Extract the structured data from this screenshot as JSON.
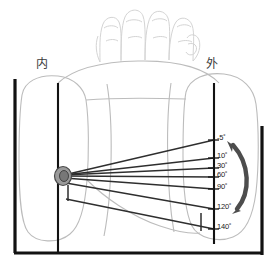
{
  "diagram": {
    "side_labels": [
      {
        "name": "medial",
        "text": "内",
        "x": 36,
        "y": 61
      },
      {
        "name": "lateral",
        "text": "外",
        "x": 206,
        "y": 61
      }
    ],
    "angle_scale": {
      "axis_x": 214,
      "labels": [
        {
          "text": "-5˚",
          "value": -5,
          "y": 135,
          "tick_y": 140
        },
        {
          "text": "10˚",
          "value": 10,
          "y": 153,
          "tick_y": 158
        },
        {
          "text": "30˚",
          "value": 30,
          "y": 163,
          "tick_y": 168
        },
        {
          "text": "60˚",
          "value": 60,
          "y": 172,
          "tick_y": 177
        },
        {
          "text": "90˚",
          "value": 90,
          "y": 184,
          "tick_y": 189
        },
        {
          "text": "120˚",
          "value": 120,
          "y": 204,
          "tick_y": 209
        },
        {
          "text": "140˚",
          "value": 140,
          "y": 224,
          "tick_y": 229
        }
      ]
    },
    "colors": {
      "frame": "#121212",
      "ray": "#303030",
      "scale_axis": "#121212",
      "arc_arrow": "#4d4d4d",
      "body_outline": "#b9b9b9",
      "hand_outline": "#d2d2d2",
      "pivot_fill": "#8f8f8f",
      "text": "#1a1a1a"
    },
    "pivot": {
      "name": "joint-center",
      "x": 63,
      "y": 176,
      "rx": 8,
      "ry": 9
    },
    "frame": {
      "left_bar_x": 15,
      "left_bar_y1": 79,
      "left_bar_y2": 253,
      "right_bar_x": 262,
      "right_bar_y1": 126,
      "right_bar_y2": 255,
      "bottom_bar_y": 253,
      "bottom_x1": 15,
      "bottom_x2": 262,
      "inner_line_x": 58,
      "inner_line_y1": 83,
      "inner_line_y2": 253
    },
    "arc_arrow": {
      "name": "range-of-motion-arrow",
      "from_deg": -5,
      "to_deg": 120,
      "double_headed": true
    }
  }
}
